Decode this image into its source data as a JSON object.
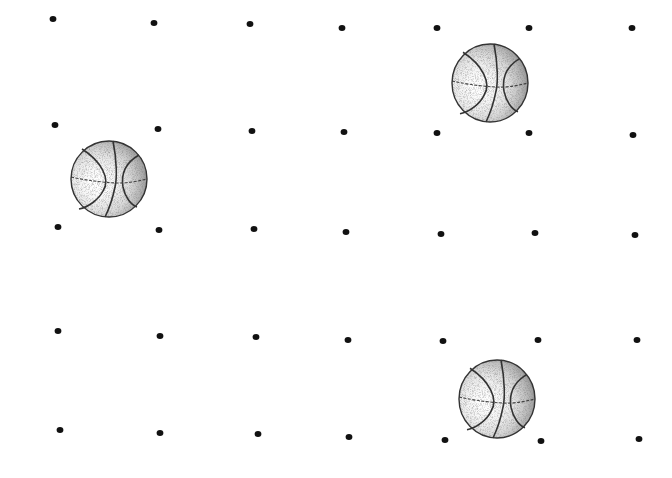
{
  "canvas": {
    "width": 672,
    "height": 478,
    "background": "#ffffff"
  },
  "dot_color": "#111111",
  "dots": [
    [
      53,
      19
    ],
    [
      154,
      23
    ],
    [
      250,
      24
    ],
    [
      342,
      28
    ],
    [
      437,
      28
    ],
    [
      529,
      28
    ],
    [
      632,
      28
    ],
    [
      55,
      125
    ],
    [
      158,
      129
    ],
    [
      252,
      131
    ],
    [
      344,
      132
    ],
    [
      437,
      133
    ],
    [
      529,
      133
    ],
    [
      633,
      135
    ],
    [
      58,
      227
    ],
    [
      159,
      230
    ],
    [
      254,
      229
    ],
    [
      346,
      232
    ],
    [
      441,
      234
    ],
    [
      535,
      233
    ],
    [
      635,
      235
    ],
    [
      58,
      331
    ],
    [
      160,
      336
    ],
    [
      256,
      337
    ],
    [
      348,
      340
    ],
    [
      443,
      341
    ],
    [
      538,
      340
    ],
    [
      637,
      340
    ],
    [
      60,
      430
    ],
    [
      160,
      433
    ],
    [
      258,
      434
    ],
    [
      349,
      437
    ],
    [
      445,
      440
    ],
    [
      541,
      441
    ],
    [
      639,
      439
    ]
  ],
  "basketballs": [
    {
      "name": "basketball-top-right",
      "cx": 490,
      "cy": 83,
      "rx": 38,
      "ry": 39
    },
    {
      "name": "basketball-middle-left",
      "cx": 109,
      "cy": 179,
      "rx": 38,
      "ry": 38
    },
    {
      "name": "basketball-bottom-right",
      "cx": 497,
      "cy": 399,
      "rx": 38,
      "ry": 39
    }
  ]
}
